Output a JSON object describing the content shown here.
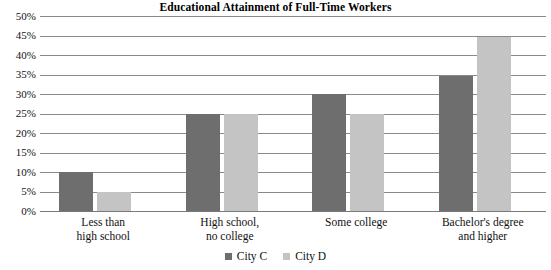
{
  "chart_data": {
    "type": "bar",
    "title": "Educational Attainment of Full-Time Workers",
    "xlabel": "",
    "ylabel": "",
    "ylim": [
      0,
      50
    ],
    "ytick_labels": [
      "50%",
      "45%",
      "40%",
      "35%",
      "30%",
      "25%",
      "20%",
      "15%",
      "10%",
      "5%",
      "0%"
    ],
    "ytick_values": [
      50,
      45,
      40,
      35,
      30,
      25,
      20,
      15,
      10,
      5,
      0
    ],
    "grid": true,
    "legend_position": "bottom-center",
    "categories": [
      "Less than high school",
      "High school, no college",
      "Some college",
      "Bachelor's degree and higher"
    ],
    "category_label_lines": [
      [
        "Less than",
        "high school"
      ],
      [
        "High school,",
        "no college"
      ],
      [
        "Some college",
        ""
      ],
      [
        "Bachelor's degree",
        "and higher"
      ]
    ],
    "series": [
      {
        "name": "City C",
        "color": "#6e6e6e",
        "values": [
          10,
          25,
          30,
          34.5
        ]
      },
      {
        "name": "City D",
        "color": "#c4c4c4",
        "values": [
          5,
          25,
          25,
          44.5
        ]
      }
    ]
  },
  "legend": {
    "items": [
      {
        "label": "City C",
        "color": "#6e6e6e"
      },
      {
        "label": "City D",
        "color": "#c4c4c4"
      }
    ]
  }
}
